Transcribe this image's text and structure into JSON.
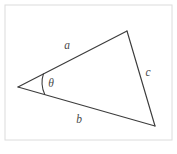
{
  "figure": {
    "kind": "geometry-diagram",
    "background_color": "#ffffff",
    "frame": {
      "name": "figure-border",
      "x": 5,
      "y": 5,
      "width": 167,
      "height": 135,
      "stroke_color": "#dcdcdc"
    },
    "triangle": {
      "stroke_color": "#3c3c3c",
      "fill_color": "#ffffff",
      "vertices": {
        "left": {
          "label": "",
          "x": 18,
          "y": 87
        },
        "top": {
          "label": "",
          "x": 127,
          "y": 31
        },
        "bottom_right": {
          "label": "",
          "x": 155,
          "y": 126
        }
      },
      "path": "M 18 87 L 127 31 L 155 126 Z",
      "sides": [
        {
          "name": "side-a",
          "label": "a",
          "from": "left",
          "to": "top",
          "path": "M 18 87 L 127 31",
          "label_x": 67,
          "label_y": 46
        },
        {
          "name": "side-c",
          "label": "c",
          "from": "top",
          "to": "bottom_right",
          "path": "M 127 31 L 155 126",
          "label_x": 148,
          "label_y": 73
        },
        {
          "name": "side-b",
          "label": "b",
          "from": "left",
          "to": "bottom_right",
          "path": "M 18 87 L 155 126",
          "label_x": 79,
          "label_y": 120
        }
      ],
      "angle": {
        "name": "angle-theta",
        "label": "θ",
        "at_vertex": "left",
        "between_sides": [
          "a",
          "b"
        ],
        "arc_path": "M 43.52 73.54 A 28 28 0 0 0 44.89 94.72",
        "label_x": 51,
        "label_y": 84
      }
    }
  }
}
